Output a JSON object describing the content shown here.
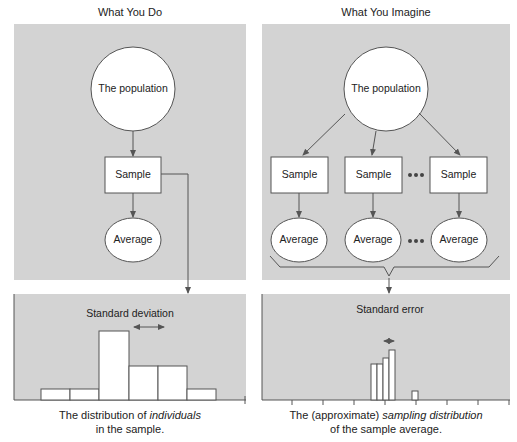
{
  "left": {
    "title": "What You Do",
    "population_label": "The population",
    "sample_label": "Sample",
    "average_label": "Average",
    "bottom": {
      "measure_label": "Standard deviation",
      "caption_line1_prefix": "The distribution of ",
      "caption_line1_italic": "individuals",
      "caption_line2": "in the sample."
    }
  },
  "right": {
    "title": "What You Imagine",
    "population_label": "The population",
    "samples": [
      {
        "label": "Sample"
      },
      {
        "label": "Sample"
      },
      {
        "label": "Sample"
      }
    ],
    "averages": [
      {
        "label": "Average"
      },
      {
        "label": "Average"
      },
      {
        "label": "Average"
      }
    ],
    "ellipsis": "•••",
    "bottom": {
      "measure_label": "Standard error",
      "caption_line1_prefix": "The (approximate) ",
      "caption_line1_italic": "sampling distribution",
      "caption_line2": "of the sample average."
    }
  },
  "colors": {
    "panel_bg": "#d3d3d3",
    "node_fill": "#ffffff",
    "stroke": "#555555"
  }
}
